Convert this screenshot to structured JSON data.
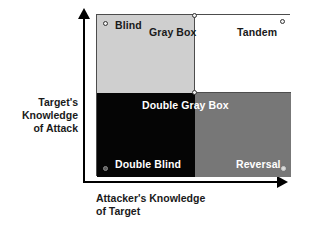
{
  "chart_data": {
    "type": "table",
    "xlabel": "Attacker's Knowledge of Target",
    "ylabel": "Target's Knowledge of Attack",
    "grid": false,
    "legend": "none",
    "categories_x": [
      "Low",
      "High"
    ],
    "categories_y": [
      "High",
      "Low"
    ],
    "cells": [
      {
        "id": "blind",
        "label": "Blind",
        "x": "Low",
        "y": "High",
        "fill": "#cfcfcf",
        "text_color": "#1a1a1a"
      },
      {
        "id": "tandem",
        "label": "Tandem",
        "x": "High",
        "y": "High",
        "fill": "#ffffff",
        "text_color": "#1a1a1a"
      },
      {
        "id": "double-blind",
        "label": "Double Blind",
        "x": "Low",
        "y": "Low",
        "fill": "#050505",
        "text_color": "#ffffff"
      },
      {
        "id": "reversal",
        "label": "Reversal",
        "x": "High",
        "y": "Low",
        "fill": "#777777",
        "text_color": "#ffffff"
      }
    ],
    "boundary_labels": [
      {
        "id": "gray-box",
        "label": "Gray Box",
        "position": "top-center-divider"
      },
      {
        "id": "double-gray-box",
        "label": "Double Gray Box",
        "position": "center-divider"
      }
    ],
    "colors": {
      "blind_fill": "#cfcfcf",
      "tandem_fill": "#ffffff",
      "double_blind_fill": "#050505",
      "reversal_fill": "#777777",
      "border": "#4d4d4d",
      "axis": "#000000",
      "text": "#1a1a1a"
    }
  },
  "axes": {
    "y": {
      "line1": "Target's",
      "line2": "Knowledge",
      "line3": "of Attack",
      "arrow_icon": "arrow-up-icon"
    },
    "x": {
      "line1": "Attacker's Knowledge",
      "line2": "of Target",
      "arrow_icon": "arrow-right-icon"
    }
  },
  "matrix": {
    "quadrants": {
      "top_left": {
        "label": "Blind"
      },
      "top_right": {
        "label": "Tandem"
      },
      "bottom_left": {
        "label": "Double Blind"
      },
      "bottom_right": {
        "label": "Reversal"
      }
    },
    "overlays": {
      "top_center": "Gray Box",
      "center": "Double Gray Box"
    }
  }
}
